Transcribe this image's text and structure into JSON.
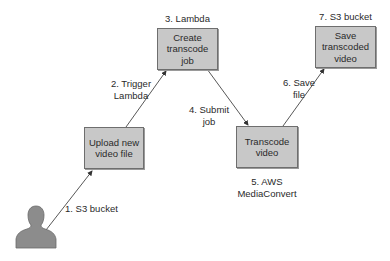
{
  "diagram": {
    "nodes": [
      {
        "id": "upload",
        "label_lines": [
          "Upload new",
          "video file"
        ],
        "caption": ""
      },
      {
        "id": "create-job",
        "label_lines": [
          "Create",
          "transcode",
          "job"
        ],
        "caption": "3. Lambda"
      },
      {
        "id": "transcode",
        "label_lines": [
          "Transcode",
          "video"
        ],
        "caption_lines": [
          "5. AWS",
          "MediaConvert"
        ]
      },
      {
        "id": "save",
        "label_lines": [
          "Save",
          "transcoded",
          "video"
        ],
        "caption": "7. S3 bucket"
      }
    ],
    "edges": [
      {
        "from": "user",
        "to": "upload",
        "label_lines": [
          "1. S3 bucket"
        ]
      },
      {
        "from": "upload",
        "to": "create-job",
        "label_lines": [
          "2. Trigger",
          "Lambda"
        ]
      },
      {
        "from": "create-job",
        "to": "transcode",
        "label_lines": [
          "4. Submit",
          "job"
        ]
      },
      {
        "from": "transcode",
        "to": "save",
        "label_lines": [
          "6. Save",
          "file"
        ]
      }
    ],
    "actor": {
      "icon": "person-icon"
    },
    "colors": {
      "box_fill": "#c8c8c8",
      "box_border": "#6e6e6e",
      "arrow": "#333333",
      "person": "#8c8c8c"
    }
  }
}
